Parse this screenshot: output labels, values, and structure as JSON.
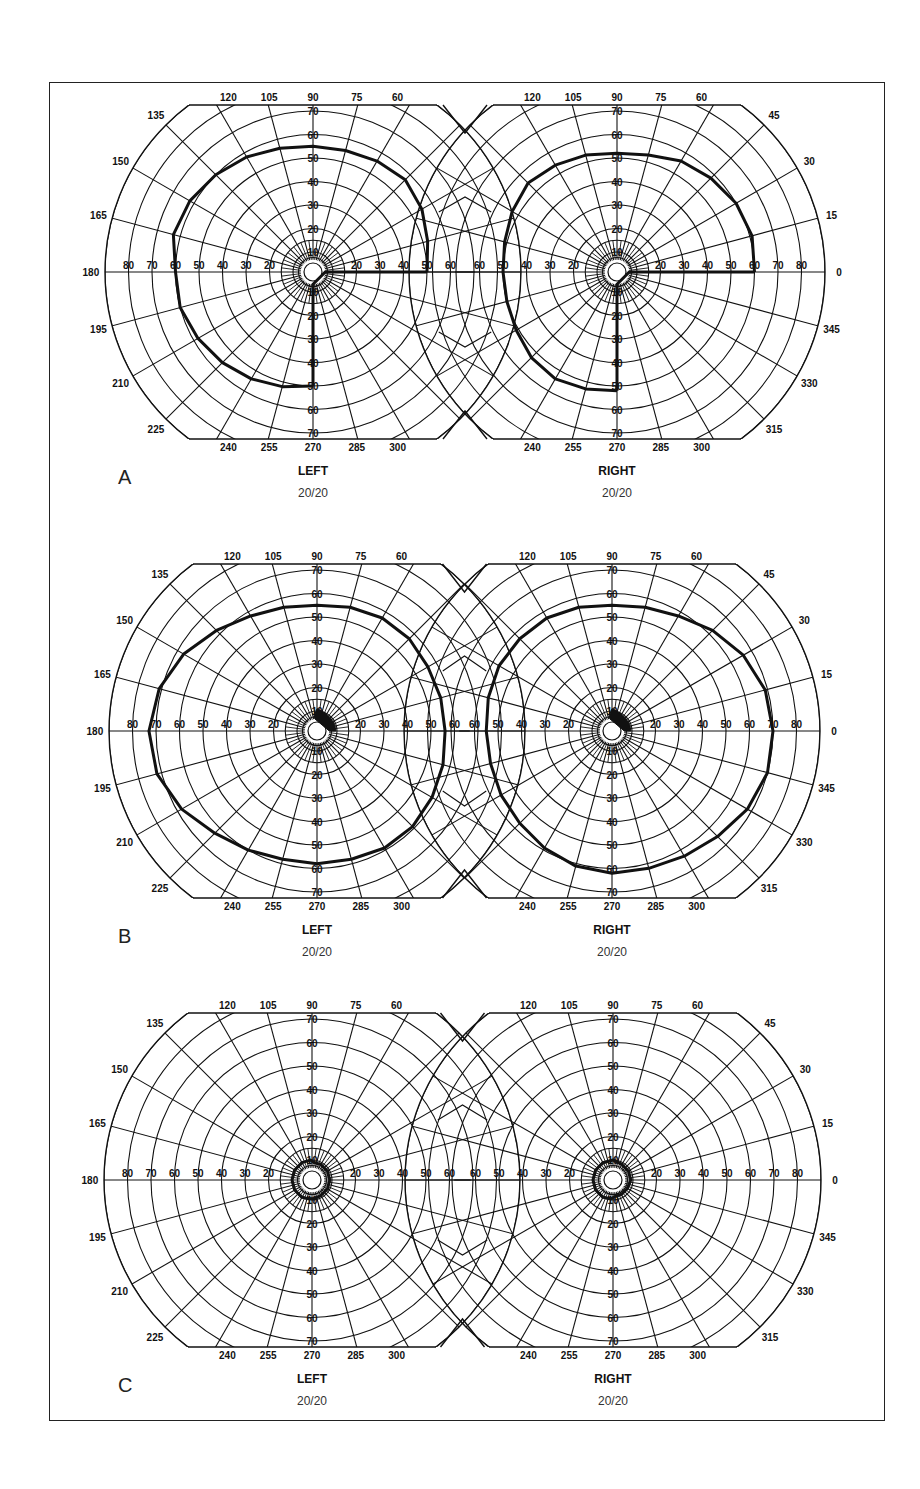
{
  "figure": {
    "panels": [
      {
        "letter": "A",
        "center_y": 272,
        "left": {
          "title": "LEFT",
          "acuity": "20/20",
          "cx": 313,
          "field": [
            [
              0,
              50
            ],
            [
              15,
              52
            ],
            [
              30,
              55
            ],
            [
              45,
              57
            ],
            [
              60,
              56
            ],
            [
              75,
              55
            ],
            [
              90,
              55
            ],
            [
              105,
              56
            ],
            [
              120,
              58
            ],
            [
              135,
              60
            ],
            [
              150,
              62
            ],
            [
              165,
              63
            ],
            [
              180,
              60
            ],
            [
              195,
              60
            ],
            [
              210,
              58
            ],
            [
              225,
              56
            ],
            [
              240,
              54
            ],
            [
              255,
              52
            ],
            [
              270,
              50
            ]
          ],
          "spoke_closure": [
            [
              270,
              50
            ],
            [
              270,
              3
            ],
            [
              0,
              3
            ],
            [
              0,
              50
            ]
          ],
          "central_blob": []
        },
        "right": {
          "title": "RIGHT",
          "acuity": "20/20",
          "cx": 617,
          "field": [
            [
              0,
              60
            ],
            [
              15,
              61
            ],
            [
              30,
              60
            ],
            [
              45,
              58
            ],
            [
              60,
              56
            ],
            [
              75,
              53
            ],
            [
              90,
              52
            ],
            [
              105,
              53
            ],
            [
              120,
              54
            ],
            [
              135,
              55
            ],
            [
              150,
              53
            ],
            [
              165,
              51
            ],
            [
              180,
              50
            ],
            [
              195,
              50
            ],
            [
              210,
              51
            ],
            [
              225,
              53
            ],
            [
              240,
              54
            ],
            [
              255,
              53
            ],
            [
              270,
              52
            ]
          ],
          "spoke_closure": [
            [
              270,
              52
            ],
            [
              270,
              3
            ],
            [
              0,
              3
            ],
            [
              0,
              60
            ]
          ],
          "central_blob": []
        }
      },
      {
        "letter": "B",
        "center_y": 731,
        "left": {
          "title": "LEFT",
          "acuity": "20/20",
          "cx": 317,
          "field": [
            [
              0,
              56
            ],
            [
              15,
              56
            ],
            [
              30,
              56
            ],
            [
              45,
              57
            ],
            [
              60,
              57
            ],
            [
              75,
              56
            ],
            [
              90,
              55
            ],
            [
              105,
              56
            ],
            [
              120,
              58
            ],
            [
              135,
              62
            ],
            [
              150,
              67
            ],
            [
              165,
              71
            ],
            [
              180,
              73
            ],
            [
              195,
              72
            ],
            [
              210,
              68
            ],
            [
              225,
              63
            ],
            [
              240,
              60
            ],
            [
              255,
              58
            ],
            [
              270,
              58
            ],
            [
              285,
              58
            ],
            [
              300,
              59
            ],
            [
              315,
              59
            ],
            [
              330,
              58
            ],
            [
              345,
              57
            ]
          ],
          "central_blob": [
            [
              0,
              3
            ],
            [
              0,
              9
            ],
            [
              20,
              9
            ],
            [
              45,
              9
            ],
            [
              70,
              10
            ],
            [
              90,
              11
            ],
            [
              100,
              6
            ],
            [
              100,
              3
            ]
          ]
        },
        "right": {
          "title": "RIGHT",
          "acuity": "20/20",
          "cx": 612,
          "field": [
            [
              0,
              70
            ],
            [
              15,
              69
            ],
            [
              30,
              66
            ],
            [
              45,
              62
            ],
            [
              60,
              58
            ],
            [
              75,
              56
            ],
            [
              90,
              55
            ],
            [
              105,
              56
            ],
            [
              120,
              57
            ],
            [
              135,
              57
            ],
            [
              150,
              57
            ],
            [
              165,
              56
            ],
            [
              180,
              55
            ],
            [
              195,
              55
            ],
            [
              210,
              56
            ],
            [
              225,
              57
            ],
            [
              240,
              59
            ],
            [
              255,
              61
            ],
            [
              270,
              62
            ],
            [
              285,
              62
            ],
            [
              300,
              63
            ],
            [
              315,
              65
            ],
            [
              330,
              68
            ],
            [
              345,
              70
            ]
          ],
          "central_blob": [
            [
              0,
              3
            ],
            [
              0,
              9
            ],
            [
              20,
              9
            ],
            [
              45,
              9
            ],
            [
              70,
              10
            ],
            [
              90,
              11
            ],
            [
              100,
              6
            ],
            [
              100,
              3
            ]
          ]
        }
      },
      {
        "letter": "C",
        "center_y": 1180,
        "left": {
          "title": "LEFT",
          "acuity": "20/20",
          "cx": 312,
          "field": [
            [
              0,
              8
            ],
            [
              30,
              8
            ],
            [
              60,
              8
            ],
            [
              85,
              8
            ],
            [
              95,
              10
            ],
            [
              120,
              10
            ],
            [
              150,
              10
            ],
            [
              180,
              10
            ],
            [
              210,
              10
            ],
            [
              240,
              10
            ],
            [
              260,
              9
            ],
            [
              275,
              9
            ],
            [
              300,
              8
            ],
            [
              330,
              8
            ]
          ],
          "central_blob": []
        },
        "right": {
          "title": "RIGHT",
          "acuity": "20/20",
          "cx": 613,
          "field": [
            [
              0,
              8
            ],
            [
              30,
              8
            ],
            [
              60,
              8
            ],
            [
              80,
              9
            ],
            [
              90,
              10
            ],
            [
              120,
              10
            ],
            [
              150,
              10
            ],
            [
              180,
              10
            ],
            [
              210,
              10
            ],
            [
              240,
              10
            ],
            [
              265,
              9
            ],
            [
              275,
              7
            ],
            [
              300,
              7
            ],
            [
              330,
              7
            ]
          ],
          "central_blob": []
        }
      }
    ],
    "ring_labels": [
      "10",
      "20",
      "30",
      "40",
      "50",
      "60",
      "70",
      "80"
    ],
    "top_meridian_labels": [
      "120",
      "105",
      "90",
      "75",
      "60"
    ],
    "bottom_meridian_labels": [
      "240",
      "255",
      "270",
      "285",
      "300"
    ],
    "left_side_meridian_labels": [
      "135",
      "150",
      "165",
      "180",
      "195",
      "210",
      "225"
    ],
    "right_side_meridian_labels": [
      "45",
      "30",
      "15",
      "0",
      "345",
      "330",
      "315"
    ]
  }
}
